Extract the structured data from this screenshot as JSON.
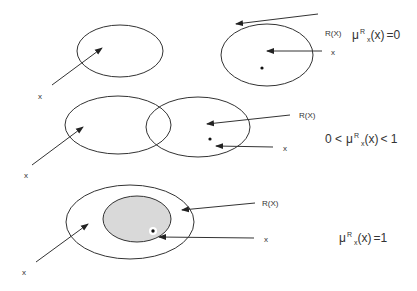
{
  "colors": {
    "stroke": "#333333",
    "shaded_fill": "#d9d9d9",
    "background": "#ffffff"
  },
  "panels": [
    {
      "id": "disjoint",
      "x_label_left": "x",
      "r_label": "R(X)",
      "x_label_right": "x",
      "equation": {
        "mu": "μ",
        "sup": "R",
        "sub": "x",
        "arg": "(x)",
        "rel": "=0",
        "prefix": ""
      }
    },
    {
      "id": "overlap",
      "x_label_top": "x",
      "x_label_left": "x",
      "r_label": "R(X)",
      "x_label_right": "x",
      "equation": {
        "mu": "μ",
        "sup": "R",
        "sub": "x",
        "arg": "(x)",
        "rel": "< 1",
        "prefix": "0 <"
      }
    },
    {
      "id": "contained",
      "x_label_left": "x",
      "r_label": "R(X)",
      "x_label_right": "x",
      "equation": {
        "mu": "μ",
        "sup": "R",
        "sub": "x",
        "arg": "(x)",
        "rel": "=1",
        "prefix": ""
      }
    }
  ]
}
